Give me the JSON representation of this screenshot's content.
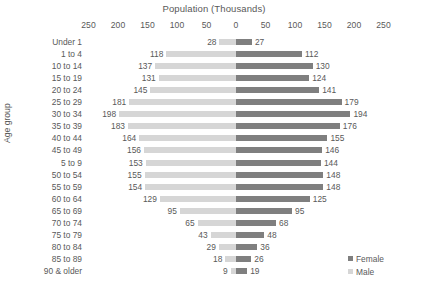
{
  "chart_data": {
    "type": "bar",
    "subtype": "population-pyramid",
    "title": "Population (Thousands)",
    "xlabel": "Population (Thousands)",
    "ylabel": "Age group",
    "orientation": "horizontal",
    "diverging": true,
    "grid": false,
    "axis_position": "top",
    "xlim": [
      -250,
      250
    ],
    "xticks": [
      250,
      200,
      150,
      100,
      50,
      0,
      50,
      100,
      150,
      200,
      250
    ],
    "xtick_labels": [
      "250",
      "200",
      "150",
      "100",
      "50",
      "0",
      "50",
      "100",
      "150",
      "200",
      "250"
    ],
    "legend_position": "bottom-right",
    "categories": [
      "Under 1",
      "1 to 4",
      "10 to 14",
      "15 to 19",
      "20 to 24",
      "25 to 29",
      "30 to 34",
      "35 to 39",
      "40 to 44",
      "45 to 49",
      "5 to 9",
      "50 to 54",
      "55 to 59",
      "60 to 64",
      "65 to 69",
      "70 to 74",
      "75 to 79",
      "80 to 84",
      "85 to 89",
      "90 & older"
    ],
    "series": [
      {
        "name": "Male",
        "side": "left",
        "color": "#d6d6d6",
        "values": [
          28,
          118,
          137,
          131,
          145,
          181,
          198,
          183,
          164,
          156,
          153,
          155,
          154,
          129,
          95,
          65,
          43,
          29,
          18,
          9
        ]
      },
      {
        "name": "Female",
        "side": "right",
        "color": "#7f7f7f",
        "values": [
          27,
          112,
          130,
          124,
          141,
          179,
          194,
          176,
          155,
          146,
          144,
          148,
          148,
          125,
          95,
          68,
          48,
          36,
          26,
          19
        ]
      }
    ]
  },
  "legend": {
    "items": [
      {
        "label": "Female",
        "color": "#7f7f7f"
      },
      {
        "label": "Male",
        "color": "#d6d6d6"
      }
    ]
  }
}
